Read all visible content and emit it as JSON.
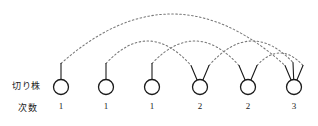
{
  "figure": {
    "labels": {
      "stump_row": "切り株",
      "degree_row": "次数"
    },
    "colors": {
      "node_stroke": "#1a1a1a",
      "node_fill": "#ffffff",
      "stem_stroke": "#1a1a1a",
      "arc_stroke": "#777777",
      "text": "#222222",
      "background": "#ffffff"
    },
    "geometry": {
      "width": 318,
      "height": 126,
      "node_radius": 7.5,
      "node_center_y": 87,
      "stem_length": 16
    },
    "nodes": [
      {
        "id": 1,
        "label": "1",
        "degree": 1,
        "cx": 61,
        "stems": 1
      },
      {
        "id": 2,
        "label": "1",
        "degree": 1,
        "cx": 106,
        "stems": 1
      },
      {
        "id": 3,
        "label": "1",
        "degree": 1,
        "cx": 152,
        "stems": 1
      },
      {
        "id": 4,
        "label": "2",
        "degree": 2,
        "cx": 200,
        "stems": 2
      },
      {
        "id": 5,
        "label": "2",
        "degree": 2,
        "cx": 248,
        "stems": 2
      },
      {
        "id": 6,
        "label": "3",
        "degree": 3,
        "cx": 294,
        "stems": 3
      }
    ],
    "arcs": [
      {
        "id": "a1",
        "from": 1,
        "to": 6,
        "apex_y": 14
      },
      {
        "id": "a2",
        "from": 2,
        "to": 4,
        "apex_y": 41
      },
      {
        "id": "a3",
        "from": 3,
        "to": 5,
        "apex_y": 41
      },
      {
        "id": "a4",
        "from": 4,
        "to": 6,
        "apex_y": 41
      },
      {
        "id": "a5",
        "from": 5,
        "to": 6,
        "apex_y": 53
      }
    ],
    "dash_pattern": "1.6 2.4"
  }
}
